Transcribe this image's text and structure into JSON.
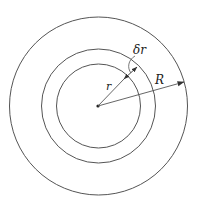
{
  "diagram": {
    "center": {
      "x": 98,
      "y": 106
    },
    "circles": [
      {
        "name": "outer",
        "radius": 89
      },
      {
        "name": "shell-outer",
        "radius": 57
      },
      {
        "name": "shell-inner",
        "radius": 42
      }
    ],
    "labels": {
      "r": "r",
      "dr": "δr",
      "R": "R"
    },
    "colors": {
      "stroke": "#555555",
      "text": "#222222"
    }
  }
}
